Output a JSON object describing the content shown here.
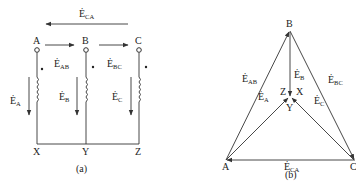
{
  "figure_a": {
    "caption": "(a)",
    "top_emf": {
      "symbol": "Ė",
      "sub": "CA"
    },
    "terminals_top": [
      "A",
      "B",
      "C"
    ],
    "terminals_bottom": [
      "X",
      "Y",
      "Z"
    ],
    "line_emfs": [
      {
        "symbol": "Ė",
        "sub": "AB"
      },
      {
        "symbol": "Ė",
        "sub": "BC"
      }
    ],
    "phase_emfs": [
      {
        "symbol": "Ė",
        "sub": "A"
      },
      {
        "symbol": "Ė",
        "sub": "B"
      },
      {
        "symbol": "Ė",
        "sub": "C"
      }
    ]
  },
  "figure_b": {
    "caption": "(b)",
    "vertices": {
      "top": "B",
      "left": "A",
      "right": "C"
    },
    "center_labels": {
      "left": "Z",
      "right": "X",
      "bottom": "Y"
    },
    "line_emfs": [
      {
        "symbol": "Ė",
        "sub": "AB"
      },
      {
        "symbol": "Ė",
        "sub": "BC"
      },
      {
        "symbol": "Ė",
        "sub": "CA"
      }
    ],
    "phase_emfs": [
      {
        "symbol": "Ė",
        "sub": "A"
      },
      {
        "symbol": "Ė",
        "sub": "B"
      },
      {
        "symbol": "Ė",
        "sub": "C"
      }
    ]
  },
  "colors": {
    "line": "#333333",
    "background": "#ffffff"
  }
}
